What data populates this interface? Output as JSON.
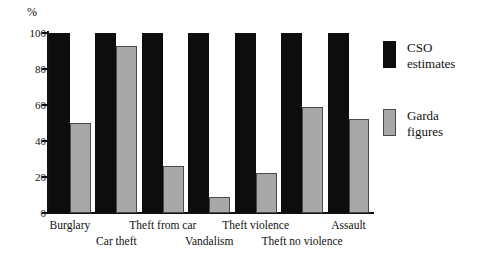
{
  "chart_data": {
    "type": "bar",
    "title": "",
    "subtitle": "",
    "xlabel": "",
    "ylabel": "%",
    "ylim": [
      0,
      100
    ],
    "yticks": [
      0,
      20,
      40,
      60,
      80,
      100
    ],
    "grid": false,
    "legend_position": "right",
    "categories": [
      "Burglary",
      "Car theft",
      "Theft from car",
      "Vandalism",
      "Theft violence",
      "Theft no violence",
      "Assault"
    ],
    "series": [
      {
        "name": "CSO estimates",
        "color": "#0d0d0d",
        "values": [
          100,
          100,
          100,
          100,
          100,
          100,
          100
        ]
      },
      {
        "name": "Garda figures",
        "color": "#a8a8a8",
        "values": [
          50,
          93,
          26,
          9,
          22,
          59,
          52
        ]
      }
    ]
  },
  "axis": {
    "y_unit": "%",
    "y_tick_labels": [
      "100",
      "80",
      "60",
      "40",
      "20",
      "0"
    ]
  },
  "legend": {
    "items": [
      {
        "label_line1": "CSO",
        "label_line2": "estimates",
        "swatch": "black-swatch"
      },
      {
        "label_line1": "Garda",
        "label_line2": "figures",
        "swatch": "gray-swatch"
      }
    ]
  },
  "x_labels": [
    {
      "text": "Burglary",
      "row": "top"
    },
    {
      "text": "Car theft",
      "row": "bot"
    },
    {
      "text": "Theft from car",
      "row": "top"
    },
    {
      "text": "Vandalism",
      "row": "bot"
    },
    {
      "text": "Theft violence",
      "row": "top"
    },
    {
      "text": "Theft no violence",
      "row": "bot"
    },
    {
      "text": "Assault",
      "row": "top"
    }
  ]
}
